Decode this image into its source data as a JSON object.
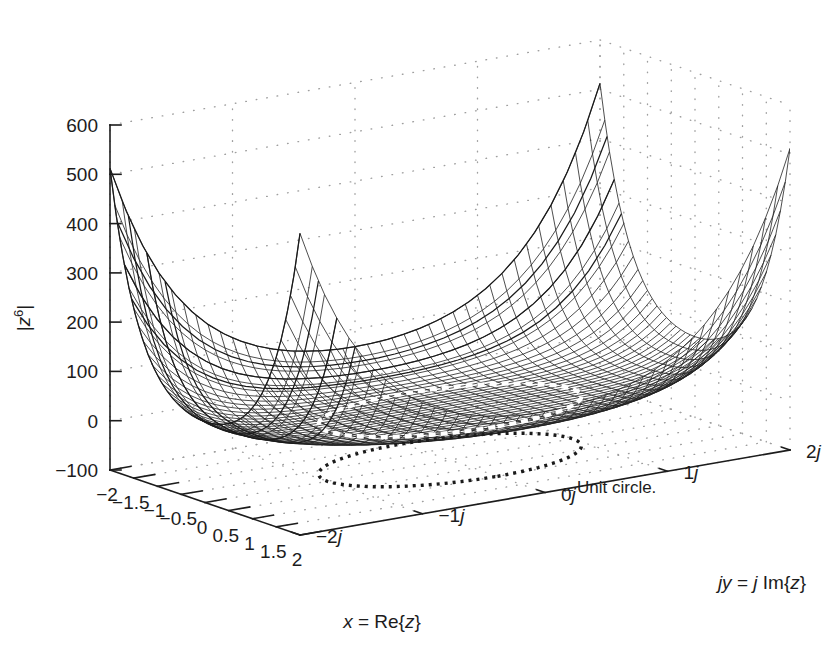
{
  "figure": {
    "kind": "matlab-3d-mesh-plot",
    "background_color": "#ffffff",
    "mesh_color": "#1a1a1a",
    "axis_color": "#1c1c1c",
    "grid_color": "#9a9a9a",
    "contour_color": "#ffffff"
  },
  "axes": {
    "z": {
      "label_parts": {
        "bar_left": "|",
        "base": "z",
        "exponent": "6",
        "bar_right": "|"
      },
      "label_text": "|z^6|",
      "ticks": [
        "600",
        "500",
        "400",
        "300",
        "200",
        "100",
        "0",
        "-100"
      ],
      "tick_values": [
        600,
        500,
        400,
        300,
        200,
        100,
        0,
        -100
      ],
      "lim": [
        -100,
        600
      ]
    },
    "x": {
      "label_parts": {
        "var": "x",
        "eq": " = ",
        "fn": "Re{",
        "arg": "z",
        "close": "}"
      },
      "label_text": "x = Re{z}",
      "ticks": [
        "-2",
        "-1.5",
        "-1",
        "-0.5",
        "0",
        "0.5",
        "1",
        "1.5",
        "2"
      ],
      "tick_values": [
        -2,
        -1.5,
        -1,
        -0.5,
        0,
        0.5,
        1,
        1.5,
        2
      ],
      "lim": [
        -2,
        2
      ]
    },
    "y": {
      "label_parts": {
        "var": "jy",
        "eq": " = ",
        "imag": "j",
        "fn": " Im{",
        "arg": "z",
        "close": "}"
      },
      "label_text": "jy = j Im{z}",
      "ticks": [
        "-2j",
        "-1j",
        "0j",
        "1j",
        "2j"
      ],
      "tick_values": [
        -2,
        -1,
        0,
        1,
        2
      ],
      "lim": [
        -2,
        2
      ]
    }
  },
  "annotations": [
    {
      "name": "unit-circle-callout",
      "text": "Unit circle.",
      "arrow": "←"
    }
  ],
  "chart_data": {
    "type": "surface",
    "title": "",
    "function": "|z^6|",
    "xlabel": "x = Re{z}",
    "ylabel": "jy = j Im{z}",
    "zlabel": "|z^6|",
    "xlim": [
      -2,
      2
    ],
    "ylim": [
      -2,
      2
    ],
    "zlim": [
      -100,
      600
    ],
    "grid": true,
    "legend": "none",
    "mesh_resolution": {
      "nx": 41,
      "ny": 41
    },
    "overlays": [
      {
        "name": "unit-circle-on-surface",
        "radius": 1,
        "z": 1,
        "style": "dashed-white"
      },
      {
        "name": "unit-circle-floor-projection",
        "radius": 1,
        "z": -100,
        "style": "dashed-black"
      }
    ],
    "sample_points": [
      {
        "x": 0,
        "y": 0,
        "z": 0
      },
      {
        "x": 1,
        "y": 0,
        "z": 1
      },
      {
        "x": -1,
        "y": 0,
        "z": 1
      },
      {
        "x": 0,
        "y": 1,
        "z": 1
      },
      {
        "x": 1.5,
        "y": 0,
        "z": 11.4
      },
      {
        "x": 2,
        "y": 0,
        "z": 64
      },
      {
        "x": -2,
        "y": 0,
        "z": 64
      },
      {
        "x": 0,
        "y": 2,
        "z": 64
      },
      {
        "x": 2,
        "y": 2,
        "z": 512
      },
      {
        "x": -2,
        "y": -2,
        "z": 512
      },
      {
        "x": -2,
        "y": 2,
        "z": 512
      },
      {
        "x": 2,
        "y": -2,
        "z": 512
      }
    ]
  }
}
